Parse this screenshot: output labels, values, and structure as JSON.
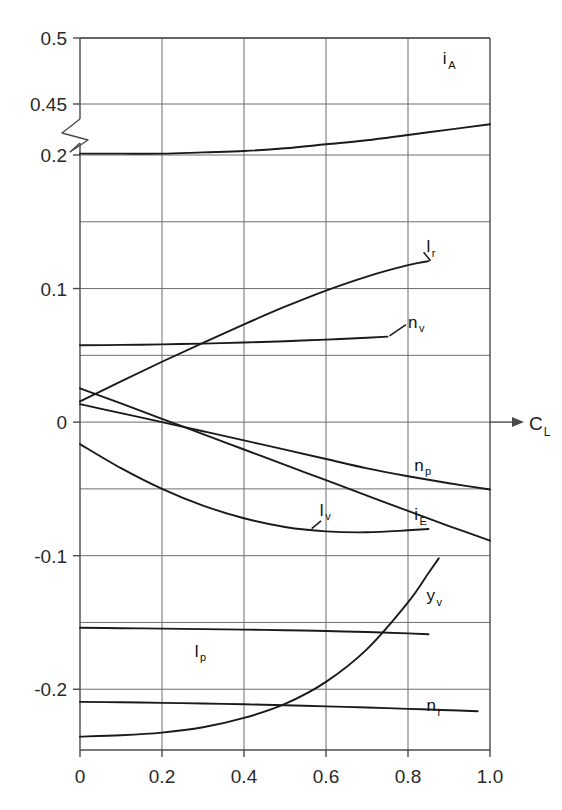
{
  "chart_data": {
    "type": "line",
    "title": "",
    "subtitle": "",
    "xlabel": "C_L",
    "xlabel_base": "C",
    "xlabel_sub": "L",
    "ylabel": "",
    "xlim": [
      0,
      1.0
    ],
    "grid": true,
    "legend_position": "inline-end-labels",
    "broken_yaxis": true,
    "break_between": [
      0.2,
      0.45
    ],
    "x_ticks": [
      "0",
      "0.2",
      "0.4",
      "0.6",
      "0.8",
      "1.0"
    ],
    "x_tick_values": [
      0,
      0.2,
      0.4,
      0.6,
      0.8,
      1.0
    ],
    "y_ticks": [
      "0.5",
      "0.45",
      "0.2",
      "0.1",
      "0",
      "-0.1",
      "-0.2"
    ],
    "y_tick_values": [
      0.5,
      0.45,
      0.2,
      0.1,
      0,
      -0.1,
      -0.2
    ],
    "series": [
      {
        "name": "i_C",
        "base": "i",
        "sub": "C",
        "label_x": 0.81,
        "label_y": 0.427,
        "x": [
          0,
          0.1,
          0.2,
          0.3,
          0.4,
          0.5,
          0.6,
          0.7,
          0.8,
          0.9,
          1.0
        ],
        "values": [
          0.443,
          0.443,
          0.443,
          0.443,
          0.443,
          0.442,
          0.441,
          0.439,
          0.436,
          0.433,
          0.43
        ]
      },
      {
        "name": "i_A",
        "base": "i",
        "sub": "A",
        "label_x": 0.885,
        "label_y": 0.268,
        "x": [
          0,
          0.1,
          0.2,
          0.3,
          0.4,
          0.5,
          0.6,
          0.7,
          0.8,
          0.9,
          1.0
        ],
        "values": [
          0.201,
          0.201,
          0.201,
          0.202,
          0.203,
          0.205,
          0.208,
          0.211,
          0.215,
          0.219,
          0.223
        ]
      },
      {
        "name": "l_r",
        "base": "l",
        "sub": "r",
        "label_x": 0.845,
        "label_y": 0.127,
        "x": [
          0,
          0.1,
          0.2,
          0.3,
          0.4,
          0.5,
          0.6,
          0.7,
          0.8,
          0.85
        ],
        "values": [
          0.0155,
          0.0305,
          0.0452,
          0.0594,
          0.0732,
          0.0864,
          0.0985,
          0.109,
          0.1175,
          0.1205
        ]
      },
      {
        "name": "n_v",
        "base": "n",
        "sub": "v",
        "label_x": 0.8,
        "label_y": 0.0705,
        "x": [
          0,
          0.1,
          0.2,
          0.3,
          0.4,
          0.5,
          0.6,
          0.7,
          0.75
        ],
        "values": [
          0.0575,
          0.0578,
          0.0582,
          0.0588,
          0.0596,
          0.0606,
          0.0618,
          0.0632,
          0.064
        ]
      },
      {
        "name": "n_p",
        "base": "n",
        "sub": "p",
        "label_x": 0.815,
        "label_y": -0.0365,
        "x": [
          0,
          0.1,
          0.2,
          0.3,
          0.4,
          0.5,
          0.6,
          0.7,
          0.8,
          0.9,
          1.0
        ],
        "values": [
          0.0135,
          0.0067,
          0.0,
          -0.0068,
          -0.0137,
          -0.0206,
          -0.0276,
          -0.0346,
          -0.0405,
          -0.0458,
          -0.0505
        ]
      },
      {
        "name": "i_E",
        "base": "i",
        "sub": "E",
        "label_x": 0.815,
        "label_y": -0.0735,
        "x": [
          0,
          0.1,
          0.2,
          0.3,
          0.4,
          0.5,
          0.6,
          0.7,
          0.8,
          0.9,
          1.0
        ],
        "values": [
          0.0253,
          0.014,
          0.0025,
          -0.009,
          -0.0205,
          -0.032,
          -0.0435,
          -0.055,
          -0.0665,
          -0.0778,
          -0.0888
        ]
      },
      {
        "name": "l_v",
        "base": "l",
        "sub": "v",
        "label_x": 0.585,
        "label_y": -0.07,
        "x": [
          0,
          0.1,
          0.2,
          0.3,
          0.4,
          0.5,
          0.6,
          0.7,
          0.8,
          0.85
        ],
        "values": [
          -0.0165,
          -0.0345,
          -0.05,
          -0.0625,
          -0.072,
          -0.0785,
          -0.0818,
          -0.0825,
          -0.081,
          -0.08
        ]
      },
      {
        "name": "y_v",
        "base": "y",
        "sub": "v",
        "label_x": 0.845,
        "label_y": -0.134,
        "x": [
          0,
          0.1,
          0.2,
          0.3,
          0.4,
          0.5,
          0.6,
          0.7,
          0.8,
          0.85,
          0.875
        ],
        "values": [
          -0.2355,
          -0.2345,
          -0.2325,
          -0.2285,
          -0.2215,
          -0.211,
          -0.1945,
          -0.17,
          -0.135,
          -0.113,
          -0.102
        ]
      },
      {
        "name": "l_p",
        "base": "l",
        "sub": "p",
        "label_x": 0.28,
        "label_y": -0.1755,
        "x": [
          0,
          0.1,
          0.2,
          0.3,
          0.4,
          0.5,
          0.6,
          0.7,
          0.8,
          0.85
        ],
        "values": [
          -0.154,
          -0.1543,
          -0.1546,
          -0.155,
          -0.1554,
          -0.1558,
          -0.1564,
          -0.1572,
          -0.1582,
          -0.1588
        ]
      },
      {
        "name": "n_r",
        "base": "n",
        "sub": "r",
        "label_x": 0.845,
        "label_y": -0.2165,
        "x": [
          0,
          0.1,
          0.2,
          0.3,
          0.4,
          0.5,
          0.6,
          0.7,
          0.8,
          0.9,
          0.97
        ],
        "values": [
          -0.2095,
          -0.2098,
          -0.2102,
          -0.2107,
          -0.2113,
          -0.212,
          -0.2128,
          -0.2137,
          -0.2147,
          -0.2157,
          -0.2165
        ]
      }
    ],
    "colors": {
      "curve": "#1a1a1a",
      "grid": "#6d6d6d",
      "frame": "#4a4a4a",
      "text": "#1a1a1a",
      "background": "#ffffff"
    }
  }
}
